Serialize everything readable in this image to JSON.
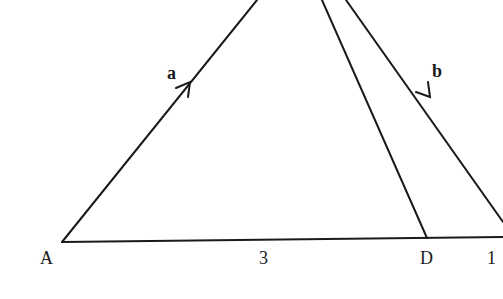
{
  "diagram": {
    "labels": {
      "vertex_a": "A",
      "vertex_d": "D",
      "length_ad": "3",
      "length_right": "1",
      "vector_a": "a",
      "vector_b": "b"
    },
    "stroke_color": "#1a1a1a",
    "background": "#ffffff"
  }
}
